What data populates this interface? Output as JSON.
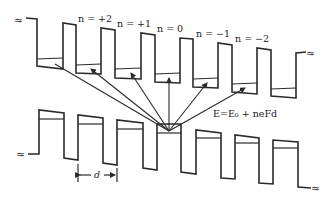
{
  "diagram": {
    "type": "energy-band-diagram",
    "labels": {
      "n_plus2": "n = +2",
      "n_plus1": "n = +1",
      "n_0": "n = 0",
      "n_minus1": "n = −1",
      "n_minus2": "n = −2",
      "energy_formula": "E=E₀ + neFd",
      "period": "d",
      "break_symbol": "≈"
    },
    "upper_band": {
      "wells": 7,
      "level_labels": [
        "n = +2",
        "n = +1",
        "n = 0",
        "n = −1",
        "n = −2"
      ]
    },
    "lower_band": {
      "wells": 6,
      "origin_well": "center"
    },
    "arrows": {
      "count": 5,
      "from": "lower-band central well level",
      "to": [
        "n = +2",
        "n = +1",
        "n = 0",
        "n = −1",
        "n = −2"
      ]
    },
    "colors": {
      "ink": "#2a2a2a",
      "background": "#ffffff"
    }
  }
}
